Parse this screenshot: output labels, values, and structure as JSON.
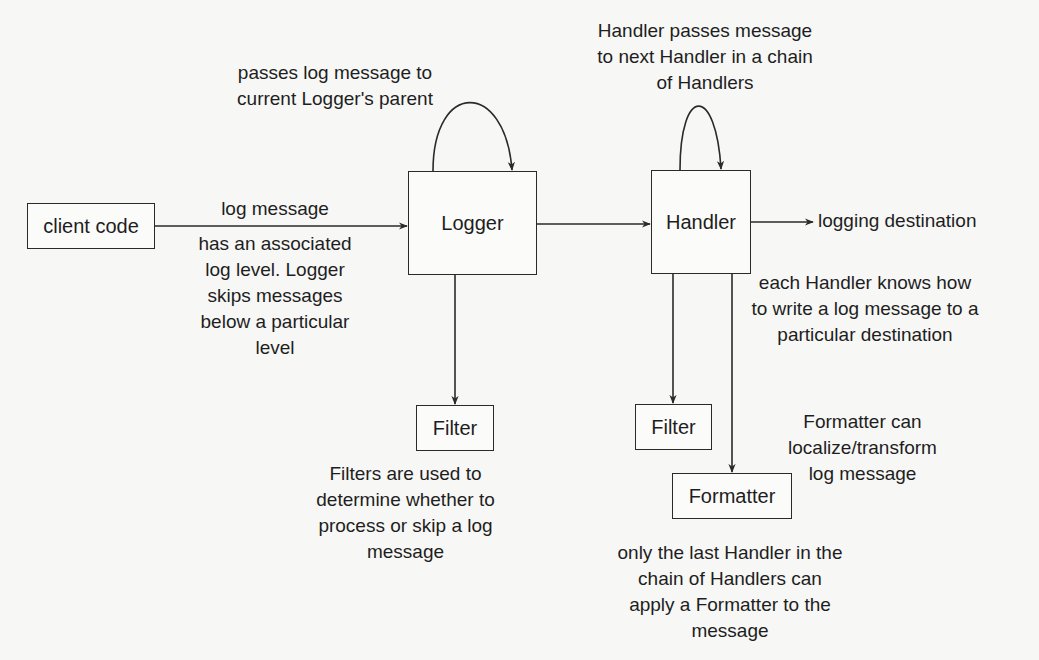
{
  "diagram": {
    "colors": {
      "background": "#f7f7f6",
      "stroke": "#2a2a2a",
      "text": "#1e1e1e"
    },
    "nodes": {
      "client_code": "client code",
      "logger": "Logger",
      "handler": "Handler",
      "filter_logger": "Filter",
      "filter_handler": "Filter",
      "formatter": "Formatter"
    },
    "edges": {
      "client_to_logger": "log message",
      "handler_to_destination": "logging destination"
    },
    "annotations": {
      "logger_parent": "passes log message to\ncurrent Logger's parent",
      "log_level": "has an associated\nlog level. Logger\nskips messages\nbelow a particular\nlevel",
      "handler_chain": "Handler passes message\nto next Handler in a chain\nof Handlers",
      "handler_destination": "each Handler knows how\nto write a log message to a\nparticular destination",
      "filter_desc": "Filters are used to\ndetermine whether to\nprocess or skip a log\nmessage",
      "formatter_desc": "Formatter can\nlocalize/transform\nlog message",
      "last_handler": "only the last Handler in the\nchain of Handlers can\napply a Formatter to the\nmessage"
    }
  }
}
